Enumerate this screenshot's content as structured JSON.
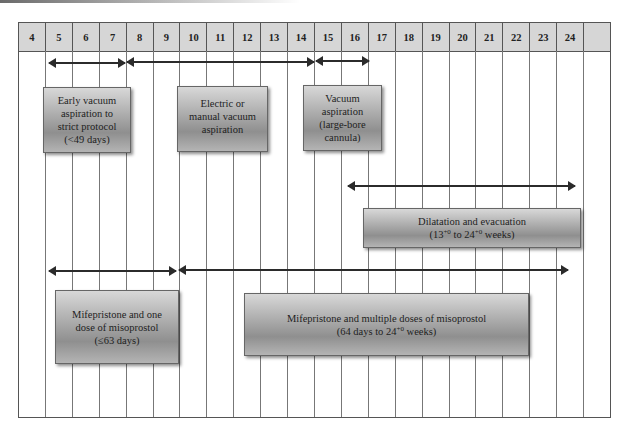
{
  "header": {
    "weeks": [
      "4",
      "5",
      "6",
      "7",
      "8",
      "9",
      "10",
      "11",
      "12",
      "13",
      "14",
      "15",
      "16",
      "17",
      "18",
      "19",
      "20",
      "21",
      "22",
      "23",
      "24",
      ""
    ]
  },
  "arrows": [
    {
      "name": "early-vacuum-range",
      "from_week": 5,
      "to_week": 7
    },
    {
      "name": "electric-manual-vacuum-range",
      "from_week": 8,
      "to_week": 14
    },
    {
      "name": "large-bore-vacuum-range",
      "from_week": 15,
      "to_week": 16
    },
    {
      "name": "dilatation-evacuation-range",
      "from_week": 16,
      "to_week": 24
    },
    {
      "name": "mifepristone-one-dose-range",
      "from_week": 5,
      "to_week": 9
    },
    {
      "name": "mifepristone-multiple-doses-range",
      "from_week": 10,
      "to_week": 24
    }
  ],
  "boxes": {
    "early_vacuum": {
      "lines": [
        "Early vacuum",
        "aspiration to",
        "strict protocol",
        "(<49 days)"
      ]
    },
    "electric_manual": {
      "lines": [
        "Electric or",
        "manual vacuum",
        "aspiration"
      ]
    },
    "large_bore": {
      "lines": [
        "Vacuum",
        "aspiration",
        "(large-bore",
        "cannula)"
      ]
    },
    "dilatation": {
      "line1": "Dilatation and evacuation",
      "line2_a": "(13",
      "line2_sup1": "+0",
      "line2_b": " to 24",
      "line2_sup2": "+0",
      "line2_c": " weeks)"
    },
    "mife_one": {
      "lines": [
        "Mifepristone and one",
        "dose of misoprostol",
        "(≤63 days)"
      ]
    },
    "mife_multi": {
      "line1": "Mifepristone and multiple doses of misoprostol",
      "line2_a": "(64 days to 24",
      "line2_sup": "+0",
      "line2_b": " weeks)"
    }
  }
}
